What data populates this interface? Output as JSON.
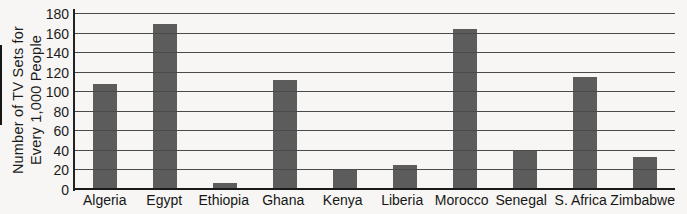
{
  "page": {
    "background": "#f7f6f4"
  },
  "chart_data": {
    "type": "bar",
    "title": "",
    "ylabel": "Number of TV Sets for Every 1,000 People",
    "ylabel_lines": [
      "Number of TV Sets for",
      "Every 1,000 People"
    ],
    "xlabel": "",
    "categories": [
      "Algeria",
      "Egypt",
      "Ethiopia",
      "Ghana",
      "Kenya",
      "Liberia",
      "Morocco",
      "Senegal",
      "S. Africa",
      "Zimbabwe"
    ],
    "values": [
      108,
      170,
      7,
      113,
      22,
      26,
      165,
      41,
      116,
      34
    ],
    "ylim": [
      0,
      180
    ],
    "ytick_step": 20,
    "yticks": [
      0,
      20,
      40,
      60,
      80,
      100,
      120,
      140,
      160,
      180
    ],
    "grid": "horizontal",
    "legend": "none",
    "bar_color": "#5c5c5c",
    "gridline_color": "#4a4a4a",
    "axis_color": "#1e1e1e",
    "text_color": "#1a1a1a"
  }
}
